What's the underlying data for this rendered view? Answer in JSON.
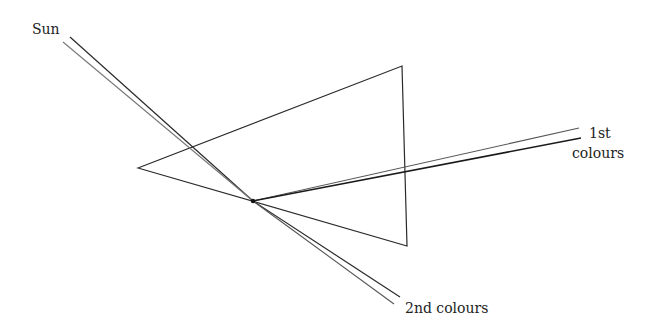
{
  "diagram": {
    "labels": {
      "sun": "Sun",
      "first_line1": "1st",
      "first_line2": "colours",
      "second": "2nd colours"
    },
    "colors": {
      "line": "#2a2a2a",
      "line_light": "#777777",
      "text": "#222222",
      "background": "#ffffff"
    },
    "prism": {
      "vertices": [
        [
          138,
          168
        ],
        [
          402,
          66
        ],
        [
          407,
          246
        ]
      ]
    },
    "convergence_point": [
      253,
      201
    ],
    "rays": {
      "sun_incoming": [
        {
          "from": [
            70,
            37
          ],
          "to": [
            253,
            201
          ]
        },
        {
          "from": [
            63,
            42
          ],
          "to": [
            253,
            201
          ]
        }
      ],
      "first_colours": [
        {
          "from": [
            253,
            201
          ],
          "to": [
            579,
            128
          ]
        },
        {
          "from": [
            253,
            201
          ],
          "to": [
            581,
            138
          ]
        }
      ],
      "second_colours": [
        {
          "from": [
            253,
            201
          ],
          "to": [
            400,
            297
          ]
        },
        {
          "from": [
            253,
            201
          ],
          "to": [
            394,
            304
          ]
        }
      ]
    }
  }
}
